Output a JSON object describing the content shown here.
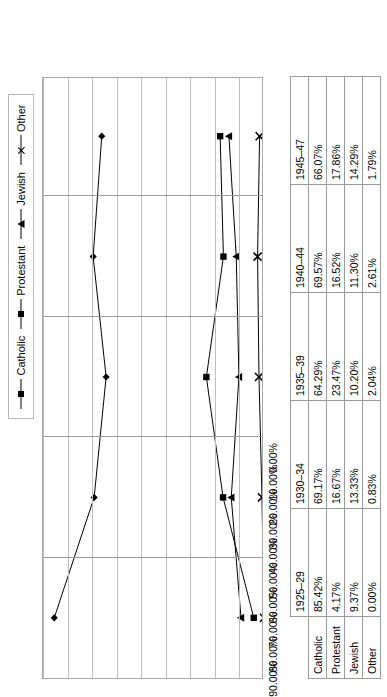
{
  "chart_data": {
    "type": "line",
    "title": "",
    "xlabel": "",
    "ylabel": "",
    "ylim": [
      0,
      90
    ],
    "grid": true,
    "legend_position": "top",
    "categories": [
      "1925–29",
      "1930–34",
      "1935–39",
      "1940–44",
      "1945–47"
    ],
    "y_ticks": [
      "0.00%",
      "10.00%",
      "20.00%",
      "30.00%",
      "40.00%",
      "50.00%",
      "60.00%",
      "70.00%",
      "80.00%",
      "90.00%"
    ],
    "y_tick_values": [
      0,
      10,
      20,
      30,
      40,
      50,
      60,
      70,
      80,
      90
    ],
    "series": [
      {
        "name": "Catholic",
        "marker": "diamond",
        "values": [
          85.42,
          69.17,
          64.29,
          69.57,
          66.07
        ],
        "labels": [
          "85.42%",
          "69.17%",
          "64.29%",
          "69.57%",
          "66.07%"
        ]
      },
      {
        "name": "Protestant",
        "marker": "square",
        "values": [
          4.17,
          16.67,
          23.47,
          16.52,
          17.86
        ],
        "labels": [
          "4.17%",
          "16.67%",
          "23.47%",
          "16.52%",
          "17.86%"
        ]
      },
      {
        "name": "Jewish",
        "marker": "triangle",
        "values": [
          9.37,
          13.33,
          10.2,
          11.3,
          14.29
        ],
        "labels": [
          "9.37%",
          "13.33%",
          "10.20%",
          "11.30%",
          "14.29%"
        ]
      },
      {
        "name": "Other",
        "marker": "cross",
        "values": [
          0.0,
          0.83,
          2.04,
          2.61,
          1.79
        ],
        "labels": [
          "0.00%",
          "0.83%",
          "2.04%",
          "2.61%",
          "1.79%"
        ]
      }
    ]
  },
  "legend": {
    "items": [
      {
        "label": "Catholic",
        "marker": "diamond"
      },
      {
        "label": "Protestant",
        "marker": "square"
      },
      {
        "label": "Jewish",
        "marker": "triangle"
      },
      {
        "label": "Other",
        "marker": "cross"
      }
    ]
  },
  "table": {
    "column_headers": [
      "1925–29",
      "1930–34",
      "1935–39",
      "1940–44",
      "1945–47"
    ],
    "rows": [
      {
        "label": "Catholic",
        "cells": [
          "85.42%",
          "69.17%",
          "64.29%",
          "69.57%",
          "66.07%"
        ]
      },
      {
        "label": "Protestant",
        "cells": [
          "4.17%",
          "16.67%",
          "23.47%",
          "16.52%",
          "17.86%"
        ]
      },
      {
        "label": "Jewish",
        "cells": [
          "9.37%",
          "13.33%",
          "10.20%",
          "11.30%",
          "14.29%"
        ]
      },
      {
        "label": "Other",
        "cells": [
          "0.00%",
          "0.83%",
          "2.04%",
          "2.61%",
          "1.79%"
        ]
      }
    ]
  },
  "colors": {
    "series_line": "#000000",
    "gridline": "#bdbdbd",
    "border": "#9a9a9a",
    "background": "#ffffff"
  }
}
